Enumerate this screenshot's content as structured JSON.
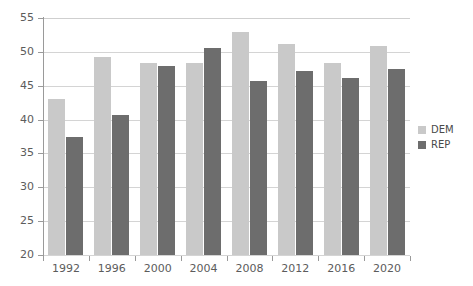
{
  "chart_data": {
    "type": "bar",
    "title": "",
    "subtitle": "",
    "xlabel": "",
    "ylabel": "",
    "categories": [
      "1992",
      "1996",
      "2000",
      "2004",
      "2008",
      "2012",
      "2016",
      "2020"
    ],
    "series": [
      {
        "name": "DEM",
        "color": "#c9c9c9",
        "values": [
          43.0,
          49.2,
          48.4,
          48.3,
          52.9,
          51.1,
          48.3,
          50.8
        ]
      },
      {
        "name": "REP",
        "color": "#6d6d6d",
        "values": [
          37.4,
          40.7,
          47.9,
          50.6,
          45.7,
          47.2,
          46.1,
          47.4
        ]
      }
    ],
    "ylim": [
      20,
      55
    ],
    "yticks": [
      "20",
      "25",
      "30",
      "35",
      "40",
      "45",
      "50",
      "55"
    ],
    "ytick_values": [
      20,
      25,
      30,
      35,
      40,
      45,
      50,
      55
    ],
    "grid": true,
    "legend_position": "right"
  },
  "legend": {
    "items": [
      {
        "label": "DEM",
        "color": "#c9c9c9"
      },
      {
        "label": "REP",
        "color": "#6d6d6d"
      }
    ]
  },
  "axis": {
    "y_tick_labels": [
      "55",
      "50",
      "45",
      "40",
      "35",
      "30",
      "25",
      "20"
    ],
    "x_tick_labels": [
      "1992",
      "1996",
      "2000",
      "2004",
      "2008",
      "2012",
      "2016",
      "2020"
    ]
  },
  "colors": {
    "dem": "#c9c9c9",
    "rep": "#6d6d6d",
    "gridline": "#d4d4d4",
    "axis": "#9a9a9a",
    "text": "#5c5c5c",
    "background": "#ffffff"
  }
}
